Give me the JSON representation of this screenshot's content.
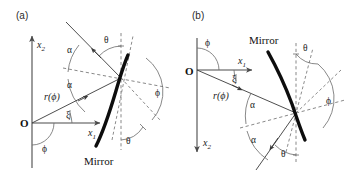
{
  "figure": {
    "width": 353,
    "height": 176,
    "background": "#ffffff",
    "ink_color": "#1a1a1a",
    "mirror_color": "#0d0d0d",
    "dash_color": "#7a7a7a"
  },
  "panels": [
    {
      "id": "a",
      "label": "(a)",
      "origin_label": "O",
      "mirror_label": "Mirror",
      "axes": [
        {
          "name": "x2",
          "base": "x",
          "sub": "2",
          "direction": "up"
        },
        {
          "name": "x1",
          "base": "x",
          "sub": "1",
          "direction": "right"
        }
      ],
      "radial_label": {
        "text": "r(ϕ)",
        "symbol": "r",
        "arg": "ϕ"
      },
      "angles": [
        {
          "name": "phi-origin",
          "symbol": "ϕ",
          "where": "below-origin"
        },
        {
          "name": "xi",
          "symbol": "ξ",
          "where": "at-origin-between-x1-and-ray"
        },
        {
          "name": "alpha-upper",
          "symbol": "α",
          "where": "between-normal-and-reflected-ray"
        },
        {
          "name": "alpha-lower",
          "symbol": "α",
          "where": "between-normal-and-incident-ray"
        },
        {
          "name": "theta-upper",
          "symbol": "θ",
          "where": "between-reflected-ray-and-vertical"
        },
        {
          "name": "theta-lower",
          "symbol": "θ",
          "where": "between-vertical-and-tangent"
        },
        {
          "name": "phi-intersection",
          "symbol": "ϕ",
          "where": "right-of-intersection"
        }
      ]
    },
    {
      "id": "b",
      "label": "(b)",
      "origin_label": "O",
      "mirror_label": "Mirror",
      "axes": [
        {
          "name": "x1",
          "base": "x",
          "sub": "1",
          "direction": "right"
        },
        {
          "name": "x2",
          "base": "x",
          "sub": "2",
          "direction": "down"
        }
      ],
      "radial_label": {
        "text": "r(ϕ)",
        "symbol": "r",
        "arg": "ϕ"
      },
      "angles": [
        {
          "name": "phi-origin",
          "symbol": "ϕ",
          "where": "above-origin"
        },
        {
          "name": "xi",
          "symbol": "ξ",
          "where": "at-origin-between-x1-and-ray"
        },
        {
          "name": "alpha-upper",
          "symbol": "α",
          "where": "between-incident-ray-and-normal"
        },
        {
          "name": "alpha-lower",
          "symbol": "α",
          "where": "between-normal-and-reflected-ray"
        },
        {
          "name": "theta-upper",
          "symbol": "θ",
          "where": "between-vertical-and-tangent"
        },
        {
          "name": "theta-lower",
          "symbol": "θ",
          "where": "between-reflected-ray-and-vertical"
        },
        {
          "name": "phi-intersection",
          "symbol": "ϕ",
          "where": "right-of-intersection"
        }
      ]
    }
  ]
}
